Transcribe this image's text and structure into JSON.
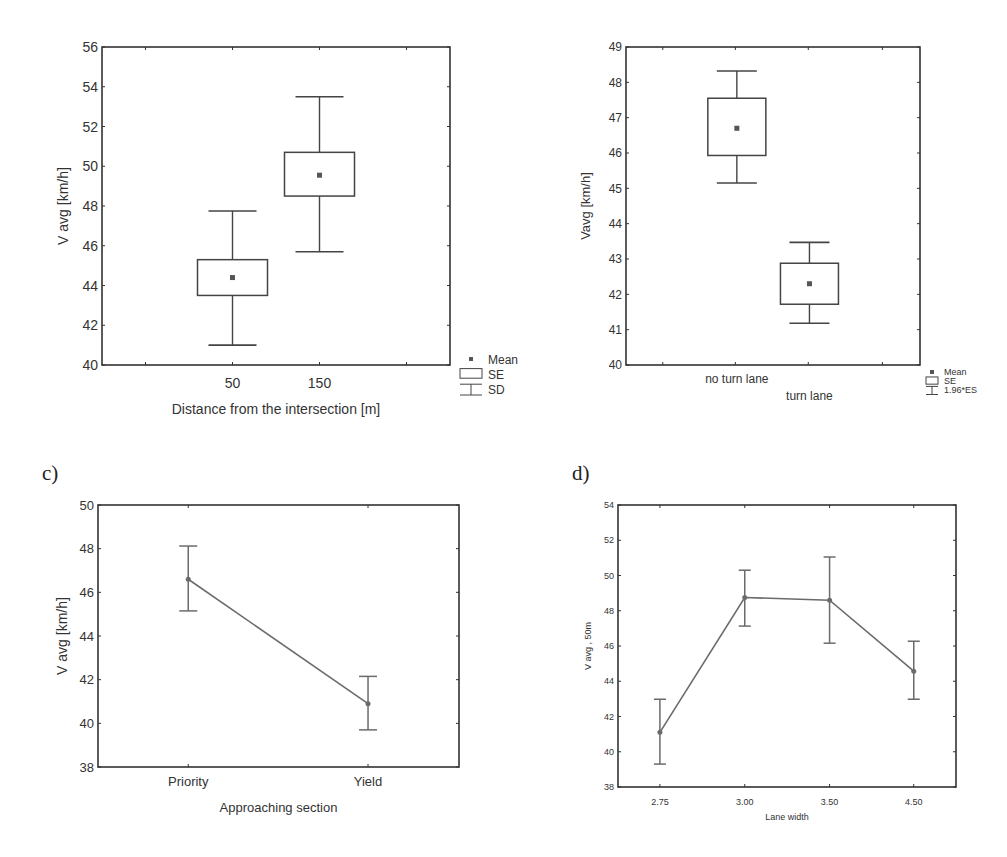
{
  "panels": {
    "a": {
      "label": ""
    },
    "b": {
      "label": ""
    },
    "c": {
      "label": "c)"
    },
    "d": {
      "label": "d)"
    }
  },
  "colors": {
    "frame": "#333333",
    "series": "#6b6b6b",
    "marker": "#555555",
    "text": "#333333"
  },
  "chart_data": [
    {
      "id": "a",
      "type": "boxplot",
      "title": "",
      "xlabel": "Distance from the intersection [m]",
      "ylabel": "V avg [km/h]",
      "ylim": [
        40,
        56
      ],
      "yticks": [
        40,
        42,
        44,
        46,
        48,
        50,
        52,
        54,
        56
      ],
      "categories": [
        "50",
        "150"
      ],
      "mean": [
        44.4,
        49.55
      ],
      "se_low": [
        43.5,
        48.5
      ],
      "se_high": [
        45.3,
        50.7
      ],
      "whisker_low": [
        41.0,
        45.7
      ],
      "whisker_high": [
        47.75,
        53.5
      ],
      "legend": [
        "Mean",
        "SE",
        "SD"
      ],
      "legend_position": "bottom-right outside",
      "grid": false
    },
    {
      "id": "b",
      "type": "boxplot",
      "title": "",
      "xlabel": "",
      "ylabel": "Vavg [km/h]",
      "ylim": [
        40,
        49
      ],
      "yticks": [
        40,
        41,
        42,
        43,
        44,
        45,
        46,
        47,
        48,
        49
      ],
      "categories": [
        "no turn lane",
        "turn lane"
      ],
      "mean": [
        46.7,
        42.3
      ],
      "se_low": [
        45.93,
        41.72
      ],
      "se_high": [
        47.55,
        42.88
      ],
      "whisker_low": [
        45.15,
        41.18
      ],
      "whisker_high": [
        48.32,
        43.47
      ],
      "legend": [
        "Mean",
        "SE",
        "1.96*ES"
      ],
      "legend_position": "bottom-right outside",
      "grid": false
    },
    {
      "id": "c",
      "type": "line",
      "title": "",
      "xlabel": "Approaching section",
      "ylabel": "V avg [km/h]",
      "ylim": [
        38,
        50
      ],
      "yticks": [
        38,
        40,
        42,
        44,
        46,
        48,
        50
      ],
      "categories": [
        "Priority",
        "Yield"
      ],
      "values": [
        46.6,
        40.9
      ],
      "err_low": [
        45.15,
        39.7
      ],
      "err_high": [
        48.12,
        42.15
      ],
      "grid": false
    },
    {
      "id": "d",
      "type": "line",
      "title": "",
      "xlabel": "Lane width",
      "ylabel": "V avg , 50m",
      "ylim": [
        38,
        54
      ],
      "yticks": [
        38,
        40,
        42,
        44,
        46,
        48,
        50,
        52,
        54
      ],
      "categories": [
        "2.75",
        "3.00",
        "3.50",
        "4.50"
      ],
      "values": [
        41.1,
        48.75,
        48.6,
        44.57
      ],
      "err_low": [
        39.3,
        47.13,
        46.16,
        42.98
      ],
      "err_high": [
        42.98,
        50.3,
        51.05,
        46.27
      ],
      "grid": false
    }
  ]
}
